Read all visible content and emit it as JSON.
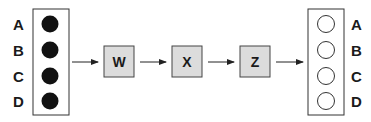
{
  "diagram": {
    "input_labels": [
      "A",
      "B",
      "C",
      "D"
    ],
    "output_labels": [
      "A",
      "B",
      "C",
      "D"
    ],
    "stages": [
      {
        "label": "W"
      },
      {
        "label": "X"
      },
      {
        "label": "Z"
      }
    ],
    "colors": {
      "filled_circle": "#111111",
      "stage_fill": "#dcdcdc",
      "stroke": "#333333",
      "empty_circle": "#ffffff"
    }
  }
}
